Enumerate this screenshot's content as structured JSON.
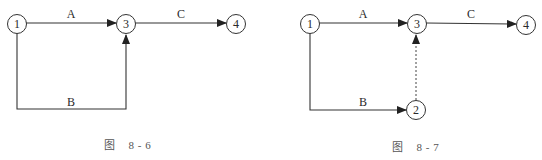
{
  "figures": [
    {
      "caption": "图    8 - 6",
      "nodes": [
        {
          "id": "1",
          "label": "1",
          "x": 17,
          "y": 24
        },
        {
          "id": "3",
          "label": "3",
          "x": 126,
          "y": 24
        },
        {
          "id": "4",
          "label": "4",
          "x": 236,
          "y": 24
        }
      ],
      "edges": [
        {
          "label": "A",
          "from": "1",
          "to": "3",
          "style": "solid"
        },
        {
          "label": "B",
          "from": "1",
          "to": "3",
          "style": "solid",
          "routing": "down-right-up"
        },
        {
          "label": "C",
          "from": "3",
          "to": "4",
          "style": "solid"
        }
      ]
    },
    {
      "caption": "图    8 - 7",
      "nodes": [
        {
          "id": "1",
          "label": "1",
          "x": 310,
          "y": 24
        },
        {
          "id": "3",
          "label": "3",
          "x": 417,
          "y": 24
        },
        {
          "id": "4",
          "label": "4",
          "x": 526,
          "y": 25
        },
        {
          "id": "2",
          "label": "2",
          "x": 416,
          "y": 110
        }
      ],
      "edges": [
        {
          "label": "A",
          "from": "1",
          "to": "3",
          "style": "solid"
        },
        {
          "label": "B",
          "from": "1",
          "to": "2",
          "style": "solid",
          "routing": "down-right"
        },
        {
          "label": "C",
          "from": "3",
          "to": "4",
          "style": "solid"
        },
        {
          "label": "",
          "from": "2",
          "to": "3",
          "style": "dashed",
          "note": "dummy activity"
        }
      ]
    }
  ]
}
